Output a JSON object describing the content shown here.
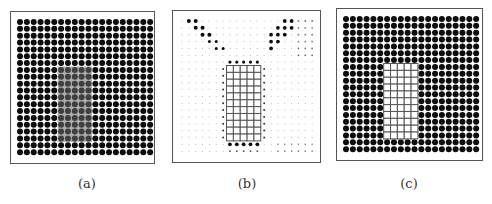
{
  "figure": {
    "panels": [
      {
        "id": "a",
        "label": "(a)",
        "description": "Dense dot lattice with a shaded rectangular region",
        "frame": {
          "x": 10,
          "y": 11,
          "w": 145,
          "h": 153
        },
        "grid": {
          "cols": 20,
          "rows": 20,
          "spacing": 6.85,
          "origin_x": 9,
          "origin_y": 10,
          "dot_radius": 3.0
        },
        "shaded_region": {
          "col_start": 6,
          "col_end": 10,
          "row_start": 7,
          "row_end": 17
        },
        "label_x": 87
      },
      {
        "id": "b",
        "label": "(b)",
        "description": "Sparse dot pattern with a grid of open squares",
        "frame": {
          "x": 172,
          "y": 10,
          "w": 149,
          "h": 153
        },
        "grid": {
          "cols": 20,
          "rows": 20,
          "spacing": 6.85,
          "origin_x": 9,
          "origin_y": 10
        },
        "square_block": {
          "col_start": 7,
          "col_end": 11,
          "row_start": 7,
          "row_end": 17
        },
        "label_x": 247
      },
      {
        "id": "c",
        "label": "(c)",
        "description": "Dense dot lattice with a grid of open squares",
        "frame": {
          "x": 336,
          "y": 8,
          "w": 147,
          "h": 153
        },
        "grid": {
          "cols": 20,
          "rows": 20,
          "spacing": 6.85,
          "origin_x": 9,
          "origin_y": 10,
          "dot_radius": 3.0
        },
        "square_block": {
          "col_start": 6,
          "col_end": 10,
          "row_start": 7,
          "row_end": 17
        },
        "label_x": 409
      }
    ],
    "labels_y": 176,
    "colors": {
      "dot": "#0d0d0d",
      "frame": "#555555",
      "shade": "#6a6a6a",
      "square_stroke": "#555555",
      "faint": "#bbbbbb"
    }
  }
}
